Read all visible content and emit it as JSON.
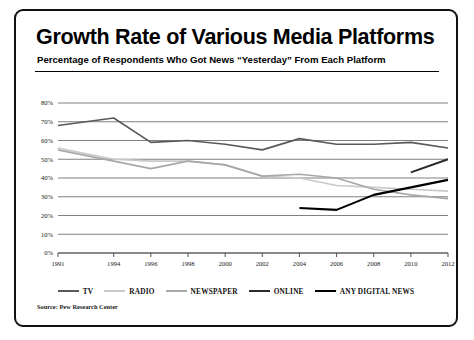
{
  "title": "Growth Rate of Various Media Platforms",
  "subtitle": "Percentage of Respondents Who Got News “Yesterday” From Each Platform",
  "source": "Source: Pew Research Center",
  "colors": {
    "tv": "#595959",
    "radio": "#c9c9c9",
    "newspaper": "#a8a8a8",
    "online": "#2b2b2b",
    "any_digital_news": "#000000",
    "gridline": "#808080",
    "axis": "#555555",
    "frame": "#111111",
    "background": "#ffffff"
  },
  "legend": {
    "position": "bottom",
    "entries": [
      {
        "label": "TV",
        "key": "tv"
      },
      {
        "label": "RADIO",
        "key": "radio"
      },
      {
        "label": "NEWSPAPER",
        "key": "newspaper"
      },
      {
        "label": "ONLINE",
        "key": "online"
      },
      {
        "label": "ANY DIGITAL NEWS",
        "key": "any_digital_news"
      }
    ]
  },
  "chart_data": {
    "type": "line",
    "title": "Growth Rate of Various Media Platforms",
    "subtitle": "Percentage of Respondents Who Got News “Yesterday” From Each Platform",
    "xlabel": "",
    "ylabel": "",
    "xlim": [
      1991,
      2012
    ],
    "ylim": [
      0,
      80
    ],
    "ytick_labels": [
      "0%",
      "10%",
      "20%",
      "30%",
      "40%",
      "50%",
      "60%",
      "70%",
      "80%"
    ],
    "ytick_values": [
      0,
      10,
      20,
      30,
      40,
      50,
      60,
      70,
      80
    ],
    "xtick_labels": [
      "1991",
      "1994",
      "1996",
      "1998",
      "2000",
      "2002",
      "2004",
      "2006",
      "2008",
      "2010",
      "2012"
    ],
    "xtick_values": [
      1991,
      1994,
      1996,
      1998,
      2000,
      2002,
      2004,
      2006,
      2008,
      2010,
      2012
    ],
    "grid": true,
    "series": [
      {
        "name": "TV",
        "key": "tv",
        "color": "#595959",
        "width": 1.6,
        "points": [
          [
            1991,
            68
          ],
          [
            1994,
            72
          ],
          [
            1996,
            59
          ],
          [
            1998,
            60
          ],
          [
            2000,
            58
          ],
          [
            2002,
            55
          ],
          [
            2004,
            61
          ],
          [
            2006,
            58
          ],
          [
            2008,
            58
          ],
          [
            2010,
            59
          ],
          [
            2012,
            56
          ]
        ]
      },
      {
        "name": "RADIO",
        "key": "radio",
        "color": "#c9c9c9",
        "width": 1.6,
        "points": [
          [
            1991,
            56
          ],
          [
            1994,
            50
          ],
          [
            1996,
            49
          ],
          [
            1998,
            49
          ],
          [
            2000,
            47
          ],
          [
            2002,
            41
          ],
          [
            2004,
            40
          ],
          [
            2006,
            36
          ],
          [
            2008,
            35
          ],
          [
            2010,
            34
          ],
          [
            2012,
            33
          ]
        ]
      },
      {
        "name": "NEWSPAPER",
        "key": "newspaper",
        "color": "#a8a8a8",
        "width": 1.6,
        "points": [
          [
            1991,
            55
          ],
          [
            1994,
            49
          ],
          [
            1996,
            45
          ],
          [
            1998,
            49
          ],
          [
            2000,
            47
          ],
          [
            2002,
            41
          ],
          [
            2004,
            42
          ],
          [
            2006,
            40
          ],
          [
            2008,
            34
          ],
          [
            2010,
            31
          ],
          [
            2012,
            29
          ]
        ]
      },
      {
        "name": "ONLINE",
        "key": "online",
        "color": "#2b2b2b",
        "width": 2.1,
        "points": [
          [
            2010,
            43
          ],
          [
            2012,
            50
          ]
        ]
      },
      {
        "name": "ANY DIGITAL NEWS",
        "key": "any_digital_news",
        "color": "#000000",
        "width": 2.1,
        "points": [
          [
            2004,
            24
          ],
          [
            2006,
            23
          ],
          [
            2008,
            31
          ],
          [
            2010,
            35
          ],
          [
            2012,
            39
          ]
        ]
      }
    ]
  }
}
